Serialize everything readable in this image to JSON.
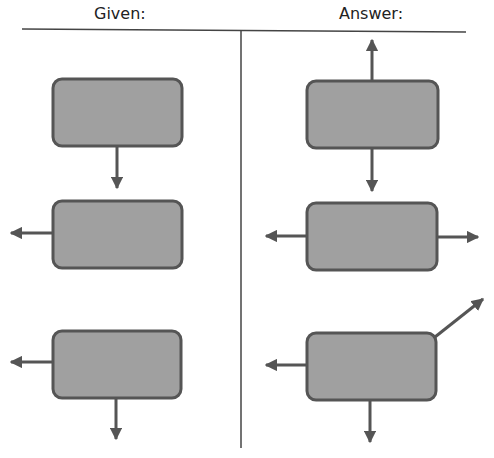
{
  "headers": {
    "given": "Given:",
    "answer": "Answer:"
  },
  "colors": {
    "box_fill": "#a0a0a0",
    "box_stroke": "#555555",
    "arrow": "#555555",
    "rule": "#333333"
  },
  "given": [
    {
      "box": [
        53,
        79,
        129,
        67
      ],
      "arrows": [
        {
          "dir": "down",
          "from": [
            117,
            146
          ],
          "to": [
            117,
            188
          ]
        }
      ]
    },
    {
      "box": [
        53,
        201,
        129,
        67
      ],
      "arrows": [
        {
          "dir": "left",
          "from": [
            53,
            233
          ],
          "to": [
            11,
            233
          ]
        }
      ]
    },
    {
      "box": [
        53,
        331,
        128,
        67
      ],
      "arrows": [
        {
          "dir": "left",
          "from": [
            53,
            362
          ],
          "to": [
            11,
            362
          ]
        },
        {
          "dir": "down",
          "from": [
            116,
            398
          ],
          "to": [
            116,
            439
          ]
        }
      ]
    }
  ],
  "answer": [
    {
      "box": [
        307,
        81,
        131,
        67
      ],
      "arrows": [
        {
          "dir": "up",
          "from": [
            372,
            81
          ],
          "to": [
            372,
            40
          ]
        },
        {
          "dir": "down",
          "from": [
            372,
            148
          ],
          "to": [
            372,
            191
          ]
        }
      ]
    },
    {
      "box": [
        307,
        203,
        130,
        67
      ],
      "arrows": [
        {
          "dir": "left",
          "from": [
            307,
            236
          ],
          "to": [
            266,
            236
          ]
        },
        {
          "dir": "right",
          "from": [
            437,
            237
          ],
          "to": [
            478,
            237
          ]
        }
      ]
    },
    {
      "box": [
        307,
        333,
        129,
        67
      ],
      "arrows": [
        {
          "dir": "left",
          "from": [
            307,
            365
          ],
          "to": [
            266,
            365
          ]
        },
        {
          "dir": "down",
          "from": [
            370,
            400
          ],
          "to": [
            370,
            442
          ]
        },
        {
          "dir": "up-right",
          "from": [
            435,
            337
          ],
          "to": [
            483,
            299
          ]
        }
      ]
    }
  ]
}
